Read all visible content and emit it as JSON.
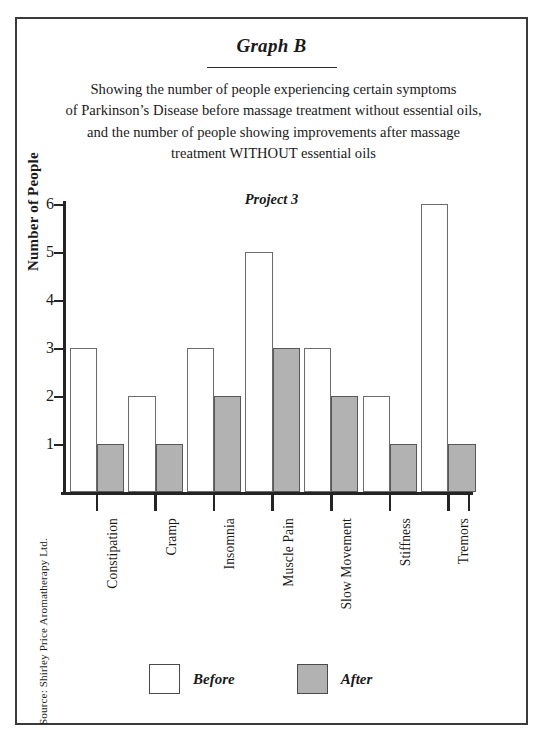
{
  "document": {
    "title": "Graph B",
    "subtitle_lines": [
      "Showing the number of people experiencing certain symptoms",
      "of Parkinson’s Disease before massage treatment without essential oils,",
      "and the number of people showing improvements after massage",
      "treatment WITHOUT essential oils"
    ],
    "project_label": "Project 3",
    "source_note": "Source: Shirley Price Aromatherapy Ltd."
  },
  "legend": {
    "entries": [
      {
        "label": "Before",
        "color": "#ffffff",
        "name": "legend-before"
      },
      {
        "label": "After",
        "color": "#b2b2b2",
        "name": "legend-after"
      }
    ]
  },
  "axis": {
    "y_ticks": [
      "1",
      "2",
      "3",
      "4",
      "5",
      "6"
    ],
    "y_title": "Number of People"
  },
  "colors": {
    "before_fill": "#ffffff",
    "after_fill": "#b2b2b2",
    "bar_stroke": "#6b6b6b",
    "axis": "#242424",
    "frame": "#3a3a3c",
    "text": "#1a1a1a"
  },
  "chart_data": {
    "type": "bar",
    "title": "Graph B",
    "subtitle": "Showing the number of people experiencing certain symptoms of Parkinson’s Disease before massage treatment without essential oils, and the number of people showing improvements after massage treatment WITHOUT essential oils",
    "annotation": "Project 3",
    "xlabel": "",
    "ylabel": "Number of People",
    "ylim": [
      0,
      6
    ],
    "ytick_step": 1,
    "grid": false,
    "legend_position": "bottom",
    "categories": [
      "Constipation",
      "Cramp",
      "Insomnia",
      "Muscle Pain",
      "Slow Movement",
      "Stiffness",
      "Tremors"
    ],
    "series": [
      {
        "name": "Before",
        "color": "#ffffff",
        "values": [
          3,
          2,
          3,
          5,
          3,
          2,
          6
        ]
      },
      {
        "name": "After",
        "color": "#b2b2b2",
        "values": [
          1,
          1,
          2,
          3,
          2,
          1,
          1
        ]
      }
    ]
  }
}
